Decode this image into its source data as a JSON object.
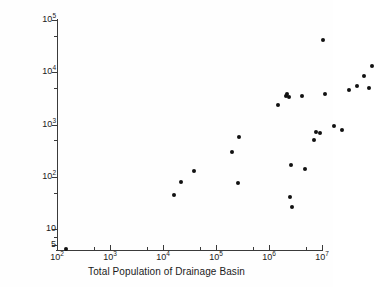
{
  "chart_data": {
    "type": "scatter",
    "title": "",
    "xlabel": "Total Population of Drainage Basin",
    "ylabel": "T-P Loading per Lake [t yr-1]",
    "ylabel_parts": {
      "text": "T-P Loading per Lake [t yr",
      "sup": "-1",
      "tail": "]"
    },
    "xscale": "log",
    "yscale": "log",
    "xlim": [
      100,
      10000000
    ],
    "ylim": [
      4,
      100000
    ],
    "grid": false,
    "legend": null,
    "marker": {
      "shape": "circle",
      "filled": true,
      "color": "#111111",
      "size_px": 4
    },
    "xticks": [
      {
        "value": 100,
        "base": "10",
        "exp": "2"
      },
      {
        "value": 1000,
        "base": "10",
        "exp": "3"
      },
      {
        "value": 10000,
        "base": "10",
        "exp": "4"
      },
      {
        "value": 100000,
        "base": "10",
        "exp": "5"
      },
      {
        "value": 1000000,
        "base": "10",
        "exp": "6"
      },
      {
        "value": 10000000,
        "base": "10",
        "exp": "7"
      }
    ],
    "yticks": [
      {
        "value": 100000,
        "base": "10",
        "exp": "5"
      },
      {
        "value": 10000,
        "base": "10",
        "exp": "4"
      },
      {
        "value": 1000,
        "base": "10",
        "exp": "3"
      },
      {
        "value": 100,
        "base": "10",
        "exp": "2"
      },
      {
        "value": 10,
        "base": "10",
        "exp": ""
      },
      {
        "value": 5,
        "base": "5",
        "exp": ""
      }
    ],
    "points": [
      {
        "x": 150,
        "y": 4.2
      },
      {
        "x": 16000,
        "y": 45
      },
      {
        "x": 22000,
        "y": 80
      },
      {
        "x": 38000,
        "y": 130
      },
      {
        "x": 200000,
        "y": 300
      },
      {
        "x": 265000,
        "y": 75
      },
      {
        "x": 275000,
        "y": 580
      },
      {
        "x": 1500000,
        "y": 2400
      },
      {
        "x": 2100000,
        "y": 3600
      },
      {
        "x": 2200000,
        "y": 3800
      },
      {
        "x": 2400000,
        "y": 3300
      },
      {
        "x": 2500000,
        "y": 42
      },
      {
        "x": 2550000,
        "y": 170
      },
      {
        "x": 2700000,
        "y": 26
      },
      {
        "x": 4200000,
        "y": 3500
      },
      {
        "x": 4700000,
        "y": 140
      },
      {
        "x": 7200000,
        "y": 500
      },
      {
        "x": 7800000,
        "y": 720
      },
      {
        "x": 9000000,
        "y": 700
      },
      {
        "x": 10500000,
        "y": 41000
      },
      {
        "x": 11500000,
        "y": 3900
      },
      {
        "x": 17000000,
        "y": 950
      },
      {
        "x": 24000000,
        "y": 780
      },
      {
        "x": 33000000,
        "y": 4600
      },
      {
        "x": 45000000,
        "y": 5400
      },
      {
        "x": 62000000,
        "y": 8600
      },
      {
        "x": 78000000,
        "y": 5100
      },
      {
        "x": 88000000,
        "y": 13000
      }
    ]
  },
  "caption_artifact": ""
}
